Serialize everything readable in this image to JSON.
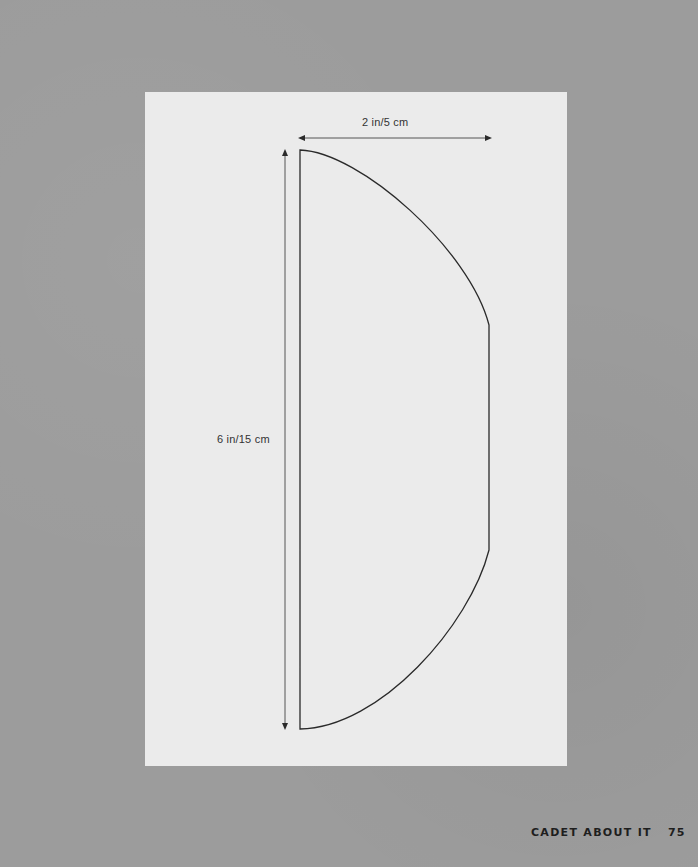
{
  "pattern": {
    "width_label": "2 in/5 cm",
    "height_label": "6 in/15 cm",
    "line_color": "#2a2a2a",
    "paper_color": "#ebebeb"
  },
  "footer": {
    "title": "CADET ABOUT IT",
    "page_number": "75"
  },
  "colors": {
    "background": "#9c9c9c",
    "text": "#1e1e1e"
  }
}
